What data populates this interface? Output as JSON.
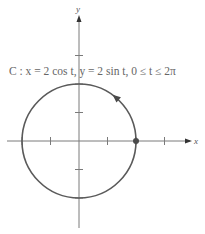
{
  "diagram": {
    "equation_label": "C : x = 2 cos t, y = 2 sin t, 0 ≤ t ≤ 2π",
    "x_axis_label": "x",
    "y_axis_label": "y",
    "curve": {
      "type": "circle",
      "center": [
        0,
        0
      ],
      "radius": 2,
      "orientation": "counterclockwise",
      "start_point": [
        2,
        0
      ]
    },
    "x_ticks": [
      -3,
      -2,
      -1,
      1,
      2,
      3
    ],
    "y_ticks": [
      -2,
      -1,
      1,
      2,
      3
    ],
    "x_range": [
      -2.5,
      4
    ],
    "y_range": [
      -3,
      4.5
    ],
    "colors": {
      "curve": "#5a5a5a",
      "axes": "#7a7a7a",
      "point": "#4a4a4a",
      "text": "#666666"
    }
  }
}
